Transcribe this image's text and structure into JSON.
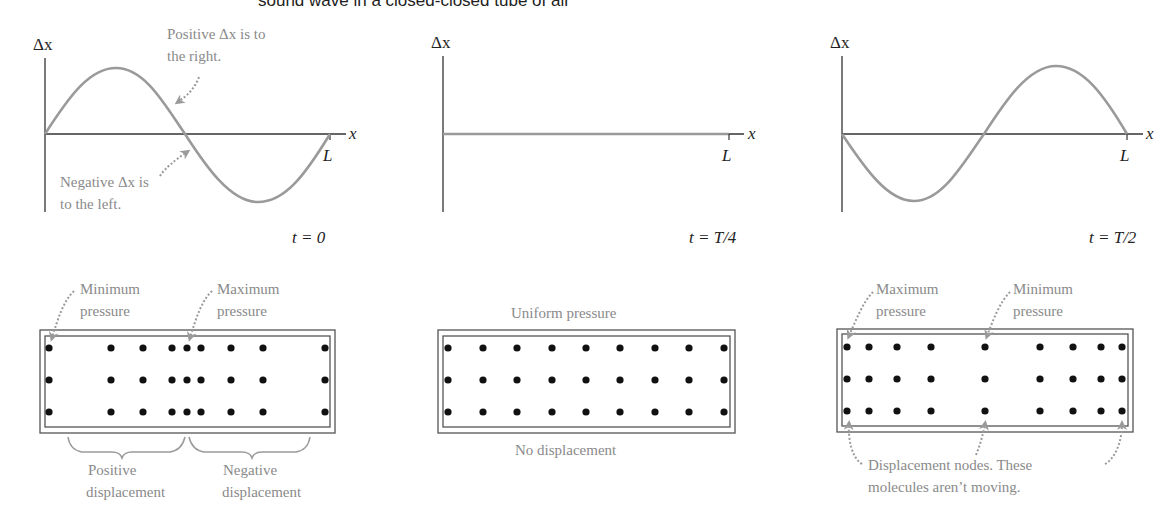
{
  "header": {
    "caption": "sound wave in a closed-closed tube of air"
  },
  "colors": {
    "curve": "#9a9a9a",
    "axis": "#333333",
    "annotation_text": "#8a8a8a",
    "arrow": "#9a9a9a",
    "molecule": "#111111",
    "tube_border": "#555555"
  },
  "graphs": [
    {
      "id": "t0",
      "y_axis_label": "Δx",
      "x_axis_label": "x",
      "tick_label": "L",
      "time_label": "t = 0",
      "annotations": [
        {
          "id": "positive",
          "lines": [
            "Positive Δx is to",
            "the right."
          ]
        },
        {
          "id": "negative",
          "lines": [
            "Negative Δx is",
            "to the left."
          ]
        }
      ]
    },
    {
      "id": "tT4",
      "y_axis_label": "Δx",
      "x_axis_label": "x",
      "tick_label": "L",
      "time_label": "t = T/4"
    },
    {
      "id": "tT2",
      "y_axis_label": "Δx",
      "x_axis_label": "x",
      "tick_label": "L",
      "time_label": "t = T/2"
    }
  ],
  "tubes": [
    {
      "id": "t0",
      "top_labels": [
        {
          "id": "min",
          "lines": [
            "Minimum",
            "pressure"
          ]
        },
        {
          "id": "max",
          "lines": [
            "Maximum",
            "pressure"
          ]
        }
      ],
      "bottom_labels": [
        {
          "id": "pos",
          "lines": [
            "Positive",
            "displacement"
          ]
        },
        {
          "id": "neg",
          "lines": [
            "Negative",
            "displacement"
          ]
        }
      ],
      "molecule_columns_x": [
        49,
        111,
        143,
        172,
        187,
        201,
        231,
        263,
        325
      ],
      "rows": 3
    },
    {
      "id": "tT4",
      "top_label": "Uniform pressure",
      "bottom_label": "No displacement",
      "molecule_columns_x": [
        448,
        483,
        517,
        552,
        586,
        620,
        655,
        689,
        724
      ],
      "rows": 3
    },
    {
      "id": "tT2",
      "top_labels": [
        {
          "id": "max",
          "lines": [
            "Maximum",
            "pressure"
          ]
        },
        {
          "id": "min",
          "lines": [
            "Minimum",
            "pressure"
          ]
        }
      ],
      "bottom_label_lines": [
        "Displacement nodes. These",
        "molecules aren’t moving."
      ],
      "molecule_columns_x": [
        847,
        869,
        897,
        931,
        985,
        1040,
        1073,
        1101,
        1122
      ],
      "rows": 3
    }
  ],
  "chart_data": {
    "type": "line",
    "xlabel": "x",
    "ylabel": "Δx",
    "x_ticks": [
      "L"
    ],
    "series": [
      {
        "name": "t = 0",
        "shape": "sin(2πx/L)",
        "x": [
          0,
          0.25,
          0.5,
          0.75,
          1.0
        ],
        "values": [
          0,
          1,
          0,
          -1,
          0
        ]
      },
      {
        "name": "t = T/4",
        "shape": "flat",
        "x": [
          0,
          0.25,
          0.5,
          0.75,
          1.0
        ],
        "values": [
          0,
          0,
          0,
          0,
          0
        ]
      },
      {
        "name": "t = T/2",
        "shape": "-sin(2πx/L)",
        "x": [
          0,
          0.25,
          0.5,
          0.75,
          1.0
        ],
        "values": [
          0,
          -1,
          0,
          1,
          0
        ]
      }
    ],
    "grid": false,
    "legend": "none"
  }
}
